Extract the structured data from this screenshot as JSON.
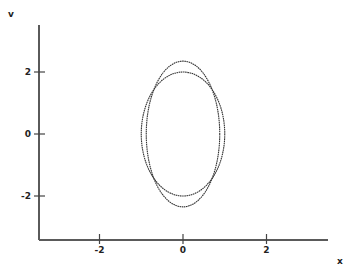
{
  "chart_data": {
    "type": "line",
    "title": "",
    "xlabel": "x",
    "ylabel": "v",
    "xlim": [
      -3.4,
      3.5
    ],
    "ylim": [
      -3.4,
      3.5
    ],
    "grid": false,
    "legend": null,
    "x_ticks": [
      -2,
      0,
      2
    ],
    "y_ticks": [
      -2,
      0,
      2
    ],
    "x_tick_labels": [
      "-2",
      "0",
      "2"
    ],
    "y_tick_labels": [
      "-2",
      "0",
      "2"
    ],
    "series": [
      {
        "name": "ellipse-1",
        "shape": "ellipse",
        "center": [
          0,
          0
        ],
        "semi_axis_x": 1.0,
        "semi_axis_y": 2.0,
        "color": "#333333"
      },
      {
        "name": "ellipse-2",
        "shape": "ellipse",
        "center": [
          0,
          0
        ],
        "semi_axis_x": 0.88,
        "semi_axis_y": 2.35,
        "color": "#333333"
      }
    ]
  },
  "layout": {
    "origin_px": [
      183,
      134
    ],
    "px_per_unit_x": 41.75,
    "px_per_unit_y": 31,
    "axis_x_px": 39,
    "axis_y_px": 240,
    "axis_x_end_px": 328,
    "axis_y_top_px": 25
  }
}
